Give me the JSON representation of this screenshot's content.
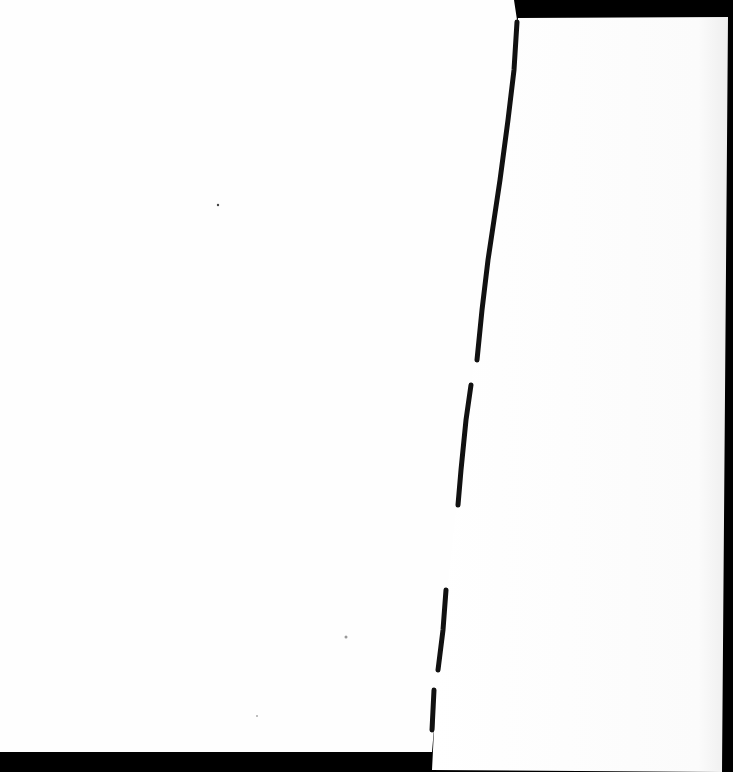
{
  "scene": {
    "description": "Scanned blank white paper torn vertically into two pieces on a black background",
    "colors": {
      "background": "#000000",
      "paper": "#fefefe",
      "paper_shadow": "#f2f2f2",
      "tear_edge": "#111111"
    },
    "pieces": [
      {
        "name": "left-paper-piece",
        "text": ""
      },
      {
        "name": "right-paper-piece",
        "text": ""
      }
    ]
  }
}
